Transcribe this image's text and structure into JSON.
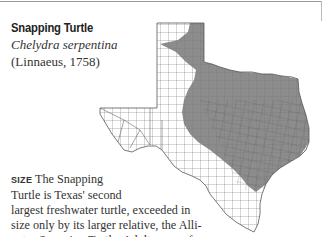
{
  "species": {
    "common_name": "Snapping Turtle",
    "scientific_name": "Chelydra serpentina",
    "authority": "(Linnaeus, 1758)"
  },
  "map": {
    "region": "Texas",
    "range_fill_color": "#8c8c8c",
    "outline_color": "#555555",
    "description": "Range covers eastern and central Texas and part of the Panhandle"
  },
  "body": {
    "section_label": "SIZE",
    "lines": [
      "The Snapping",
      "Turtle is Texas' second",
      "largest freshwater turtle, exceeded in",
      "size only by its larger relative, the Alli-",
      "gator Snapping Turtle. Adults range from"
    ]
  }
}
